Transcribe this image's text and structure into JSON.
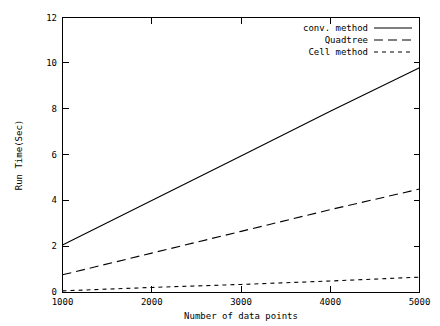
{
  "chart_data": {
    "type": "line",
    "title": "",
    "xlabel": "Number of data points",
    "ylabel": "Run Time(Sec)",
    "xlim": [
      1000,
      5000
    ],
    "ylim": [
      0,
      12
    ],
    "xticks": [
      1000,
      2000,
      3000,
      4000,
      5000
    ],
    "xtick_labels": [
      "1000",
      "2000",
      "3000",
      "4000",
      "5000"
    ],
    "yticks": [
      0,
      2,
      4,
      6,
      8,
      10,
      12
    ],
    "ytick_labels": [
      "0",
      "2",
      "4",
      "6",
      "8",
      "10",
      "12"
    ],
    "grid": false,
    "legend_position": "top-right",
    "x": [
      1000,
      2000,
      3000,
      4000,
      5000
    ],
    "series": [
      {
        "name": "conv. method",
        "style": "solid",
        "values": [
          2.05,
          4.0,
          5.95,
          7.9,
          9.8
        ]
      },
      {
        "name": "Quadtree",
        "style": "dashed",
        "values": [
          0.75,
          1.7,
          2.65,
          3.6,
          4.5
        ]
      },
      {
        "name": "Cell method",
        "style": "dotted",
        "values": [
          0.05,
          0.2,
          0.33,
          0.48,
          0.65
        ]
      }
    ]
  },
  "axes": {
    "x_title": "Number of data points",
    "y_title": "Run Time(Sec)",
    "x_tick_labels": [
      "1000",
      "2000",
      "3000",
      "4000",
      "5000"
    ],
    "y_tick_labels": [
      "0",
      "2",
      "4",
      "6",
      "8",
      "10",
      "12"
    ]
  },
  "legend": {
    "entries": [
      {
        "label": "conv. method",
        "style": "solid"
      },
      {
        "label": "Quadtree",
        "style": "dashed"
      },
      {
        "label": "Cell method",
        "style": "dotted"
      }
    ]
  },
  "colors": {
    "foreground": "#000000",
    "background": "#ffffff"
  }
}
